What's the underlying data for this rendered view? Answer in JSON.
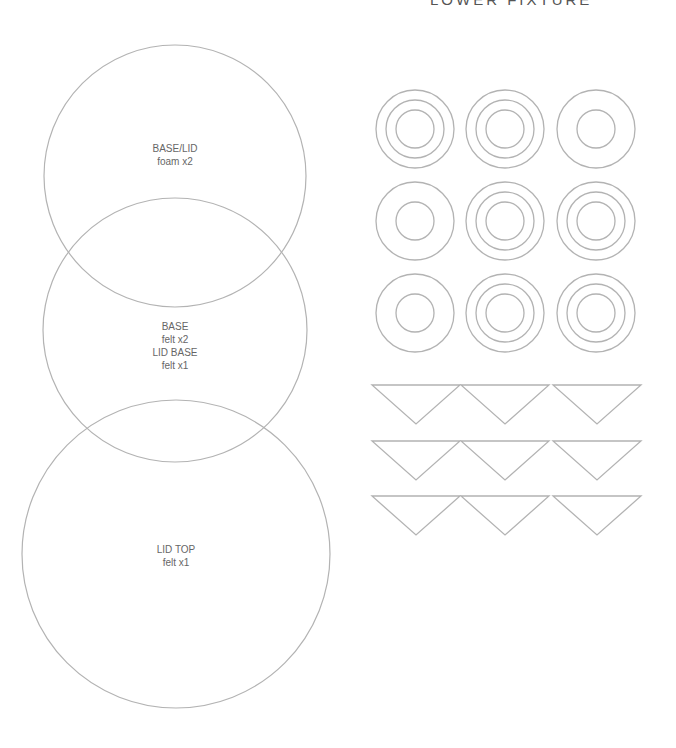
{
  "header": {
    "title": "LOWER FIXTURE"
  },
  "stroke_color": "#b3b3b3",
  "text_color": "#666666",
  "large_circles": [
    {
      "name": "base-lid",
      "cx": 175,
      "cy": 176,
      "r": 131,
      "lines": [
        "BASE/LID",
        "foam x2"
      ],
      "label_y": 142
    },
    {
      "name": "base-lid-base",
      "cx": 175,
      "cy": 330,
      "r": 132,
      "lines": [
        "BASE",
        "felt x2",
        "LID BASE",
        "felt x1"
      ],
      "label_y": 320
    },
    {
      "name": "lid-top",
      "cx": 176,
      "cy": 554,
      "r": 154,
      "lines": [
        "LID TOP",
        "felt x1"
      ],
      "label_y": 543
    }
  ],
  "ring_grid": {
    "columns_x": [
      415,
      505,
      596
    ],
    "rows_y": [
      129,
      221,
      313
    ],
    "outer_r": 39,
    "variants": [
      [
        "triple",
        "triple",
        "double"
      ],
      [
        "double",
        "triple",
        "triple"
      ],
      [
        "double",
        "triple",
        "triple"
      ]
    ],
    "triple_radii": [
      39,
      29,
      19
    ],
    "double_radii": [
      39,
      19
    ]
  },
  "triangle_grid": {
    "columns_x": [
      416,
      505,
      597
    ],
    "rows_top": [
      385,
      441,
      496
    ],
    "half_width": 44,
    "height": 39,
    "count": 9
  }
}
